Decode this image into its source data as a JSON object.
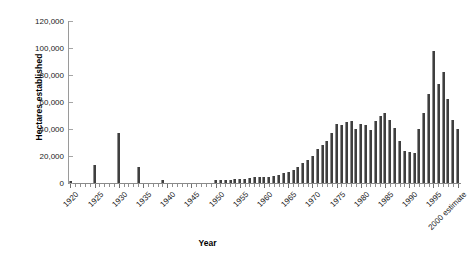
{
  "chart_data": {
    "type": "bar",
    "title": "",
    "xlabel": "Year",
    "ylabel": "Hectares established",
    "ylim": [
      0,
      120000
    ],
    "yticks": [
      0,
      20000,
      40000,
      60000,
      80000,
      100000,
      120000
    ],
    "ytick_labels": [
      "0",
      "20,000",
      "40,000",
      "60,000",
      "80,000",
      "100,000",
      "120,000"
    ],
    "grid": false,
    "legend": "none",
    "xtick_labels": [
      "1920",
      "1925",
      "1930",
      "1935",
      "1940",
      "1945",
      "1950",
      "1955",
      "1960",
      "1965",
      "1970",
      "1975",
      "1980",
      "1985",
      "1990",
      "1995",
      "2000 estimate"
    ],
    "xtick_years": [
      1920,
      1925,
      1930,
      1935,
      1940,
      1945,
      1950,
      1955,
      1960,
      1965,
      1970,
      1975,
      1980,
      1985,
      1990,
      1995,
      2000
    ],
    "bar_color": "#3f3f3f",
    "categories": [
      1920,
      1921,
      1922,
      1923,
      1924,
      1925,
      1926,
      1927,
      1928,
      1929,
      1930,
      1931,
      1932,
      1933,
      1934,
      1935,
      1936,
      1937,
      1938,
      1939,
      1940,
      1941,
      1942,
      1943,
      1944,
      1945,
      1946,
      1947,
      1948,
      1949,
      1950,
      1951,
      1952,
      1953,
      1954,
      1955,
      1956,
      1957,
      1958,
      1959,
      1960,
      1961,
      1962,
      1963,
      1964,
      1965,
      1966,
      1967,
      1968,
      1969,
      1970,
      1971,
      1972,
      1973,
      1974,
      1975,
      1976,
      1977,
      1978,
      1979,
      1980,
      1981,
      1982,
      1983,
      1984,
      1985,
      1986,
      1987,
      1988,
      1989,
      1990,
      1991,
      1992,
      1993,
      1994,
      1995,
      1996,
      1997,
      1998,
      1999,
      2000
    ],
    "values": [
      1200,
      0,
      0,
      0,
      0,
      13500,
      0,
      0,
      0,
      0,
      37000,
      0,
      0,
      0,
      12000,
      0,
      0,
      0,
      0,
      2500,
      0,
      0,
      0,
      0,
      0,
      0,
      0,
      0,
      0,
      0,
      2000,
      2200,
      2400,
      2600,
      3000,
      3200,
      2900,
      3400,
      4200,
      4400,
      4600,
      4300,
      5200,
      6200,
      7200,
      8200,
      9800,
      12000,
      14500,
      17000,
      20000,
      25000,
      28000,
      31000,
      37000,
      44000,
      43000,
      45000,
      46000,
      40000,
      44000,
      43000,
      39000,
      46000,
      50000,
      52000,
      47000,
      41000,
      31000,
      24000,
      23000,
      22000,
      40000,
      52000,
      66000,
      98000,
      73000,
      82000,
      62000,
      47000,
      40000
    ]
  }
}
